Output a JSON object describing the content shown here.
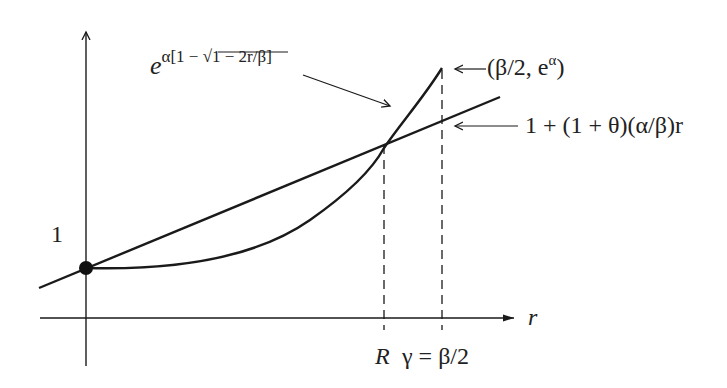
{
  "diagram": {
    "type": "function-plot",
    "axes": {
      "x_axis_label": "r",
      "y_tick_label": "1"
    },
    "curves": {
      "exponential_curve_label_base": "e",
      "exponential_curve_label_exponent": "α[1 − √1 − 2r/β]",
      "line_label": "1 + (1 + θ)(α/β)r",
      "endpoint_label": "(β/2, e^α)",
      "endpoint_label_base": "(β/2, e",
      "endpoint_label_sup": "α",
      "endpoint_label_close": ")"
    },
    "x_ticks": {
      "intersection_label": "R",
      "endpoint_label": "γ = β/2"
    },
    "points": {
      "start_point": "(0, 1)"
    },
    "colors": {
      "stroke": "#1a1a1a",
      "background": "#ffffff"
    }
  }
}
